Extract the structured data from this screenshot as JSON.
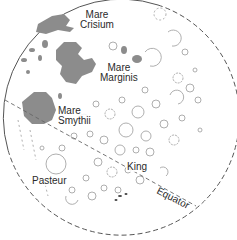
{
  "map": {
    "subject": "Moon — eastern limb",
    "colors": {
      "background": "#ffffff",
      "mare_fill": "#8c8c8c",
      "outline": "#555555",
      "crater": "#9a9a9a",
      "label": "#2a2a2a"
    },
    "labels": {
      "mare_crisium": [
        "Mare",
        "Crisium"
      ],
      "mare_marginis": [
        "Mare",
        "Marginis"
      ],
      "mare_smythii": [
        "Mare",
        "Smythii"
      ],
      "pasteur": "Pasteur",
      "king": "King",
      "equator": "Equator"
    },
    "features": [
      {
        "name": "Mare Crisium",
        "type": "mare"
      },
      {
        "name": "Mare Marginis",
        "type": "mare"
      },
      {
        "name": "Mare Smythii",
        "type": "mare"
      },
      {
        "name": "Pasteur",
        "type": "crater"
      },
      {
        "name": "King",
        "type": "crater"
      }
    ],
    "lines": [
      {
        "name": "limb",
        "style": "solid-then-dashed"
      },
      {
        "name": "equator",
        "style": "dashed"
      }
    ]
  }
}
